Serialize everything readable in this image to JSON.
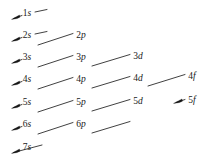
{
  "figure": {
    "width": 206,
    "height": 162,
    "background_color": "#ffffff",
    "line_color": "#2b2b2b",
    "text_color": "#1a1a1a"
  },
  "orbitals": [
    {
      "id": "1s",
      "n": "1",
      "l": "s",
      "label": "1s",
      "x": 27,
      "y": 14
    },
    {
      "id": "2s",
      "n": "2",
      "l": "s",
      "label": "2s",
      "x": 27,
      "y": 36
    },
    {
      "id": "2p",
      "n": "2",
      "l": "p",
      "label": "2p",
      "x": 81,
      "y": 36
    },
    {
      "id": "3s",
      "n": "3",
      "l": "s",
      "label": "3s",
      "x": 27,
      "y": 58
    },
    {
      "id": "3p",
      "n": "3",
      "l": "p",
      "label": "3p",
      "x": 81,
      "y": 58
    },
    {
      "id": "3d",
      "n": "3",
      "l": "d",
      "label": "3d",
      "x": 138,
      "y": 57
    },
    {
      "id": "4s",
      "n": "4",
      "l": "s",
      "label": "4s",
      "x": 27,
      "y": 80
    },
    {
      "id": "4p",
      "n": "4",
      "l": "p",
      "label": "4p",
      "x": 81,
      "y": 80
    },
    {
      "id": "4d",
      "n": "4",
      "l": "d",
      "label": "4d",
      "x": 138,
      "y": 79
    },
    {
      "id": "4f",
      "n": "4",
      "l": "f",
      "label": "4f",
      "x": 192,
      "y": 77
    },
    {
      "id": "5s",
      "n": "5",
      "l": "s",
      "label": "5s",
      "x": 27,
      "y": 103
    },
    {
      "id": "5p",
      "n": "5",
      "l": "p",
      "label": "5p",
      "x": 81,
      "y": 103
    },
    {
      "id": "5d",
      "n": "5",
      "l": "d",
      "label": "5d",
      "x": 138,
      "y": 102
    },
    {
      "id": "5f",
      "n": "5",
      "l": "f",
      "label": "5f",
      "x": 192,
      "y": 101
    },
    {
      "id": "6s",
      "n": "6",
      "l": "s",
      "label": "6s",
      "x": 27,
      "y": 125
    },
    {
      "id": "6p",
      "n": "6",
      "l": "p",
      "label": "6p",
      "x": 81,
      "y": 125
    },
    {
      "id": "7s",
      "n": "7",
      "l": "s",
      "label": "7s",
      "x": 27,
      "y": 148
    }
  ],
  "arrows": [
    {
      "id": "arrow-1s",
      "from": "1s-stub",
      "to": "1s",
      "x1": 41,
      "y1": 9,
      "x2": 14,
      "y2": 18,
      "head": true
    },
    {
      "id": "arrow-2p-2s",
      "from": "2p",
      "to": "2s",
      "x1": 41,
      "y1": 31,
      "x2": 14,
      "y2": 40,
      "head": true
    },
    {
      "id": "arrow-2p-tail",
      "from": "2p-stub",
      "to": "2p",
      "x1": 72,
      "y1": 31,
      "x2": 41,
      "y2": 41,
      "head": false
    },
    {
      "id": "arrow-3p-3s",
      "from": "3p",
      "to": "3s",
      "x1": 41,
      "y1": 53,
      "x2": 14,
      "y2": 62,
      "head": true
    },
    {
      "id": "arrow-3d-3p",
      "from": "3d",
      "to": "3p",
      "x1": 129,
      "y1": 52,
      "x2": 41,
      "y2": 81,
      "head": false
    },
    {
      "id": "arrow-4p-4s",
      "from": "4p",
      "to": "4s",
      "x1": 41,
      "y1": 75,
      "x2": 14,
      "y2": 84,
      "head": true
    },
    {
      "id": "arrow-4d-4p",
      "from": "4d",
      "to": "4p",
      "x1": 129,
      "y1": 74,
      "x2": 41,
      "y2": 103,
      "head": false
    },
    {
      "id": "arrow-4f-4d",
      "from": "4f",
      "to": "4d",
      "x1": 184,
      "y1": 72,
      "x2": 129,
      "y2": 96,
      "head": false
    },
    {
      "id": "arrow-5p-5s",
      "from": "5p",
      "to": "5s",
      "x1": 41,
      "y1": 98,
      "x2": 14,
      "y2": 107,
      "head": true
    },
    {
      "id": "arrow-5d-5p",
      "from": "5d",
      "to": "5p",
      "x1": 129,
      "y1": 97,
      "x2": 41,
      "y2": 126,
      "head": false
    },
    {
      "id": "arrow-5f",
      "from": "5f-stub",
      "to": "5f",
      "x1": 184,
      "y1": 96,
      "x2": 172,
      "y2": 104,
      "head": true
    },
    {
      "id": "arrow-6p-6s",
      "from": "6p",
      "to": "6s",
      "x1": 41,
      "y1": 120,
      "x2": 14,
      "y2": 129,
      "head": true
    },
    {
      "id": "arrow-6p-tail",
      "from": "6p-stub",
      "to": "6p",
      "x1": 129,
      "y1": 119,
      "x2": 72,
      "y2": 130,
      "head": false
    },
    {
      "id": "arrow-7s",
      "from": "7s-stub",
      "to": "7s",
      "x1": 41,
      "y1": 143,
      "x2": 14,
      "y2": 152,
      "head": true
    }
  ],
  "diagonal_segments": [
    {
      "id": "seg-2p",
      "x1": 72,
      "y1": 31,
      "x2": 41,
      "y2": 41
    },
    {
      "id": "seg-3p",
      "x1": 72,
      "y1": 53,
      "x2": 41,
      "y2": 64
    },
    {
      "id": "seg-3d-to-3p",
      "x1": 129,
      "y1": 52,
      "x2": 90,
      "y2": 64
    },
    {
      "id": "seg-4p",
      "x1": 72,
      "y1": 75,
      "x2": 41,
      "y2": 86
    },
    {
      "id": "seg-4d-to-4p",
      "x1": 129,
      "y1": 74,
      "x2": 90,
      "y2": 86
    },
    {
      "id": "seg-4f-to-4d",
      "x1": 184,
      "y1": 72,
      "x2": 147,
      "y2": 84
    },
    {
      "id": "seg-5p",
      "x1": 72,
      "y1": 98,
      "x2": 41,
      "y2": 109
    },
    {
      "id": "seg-5d-to-5p",
      "x1": 129,
      "y1": 97,
      "x2": 90,
      "y2": 109
    },
    {
      "id": "seg-6p",
      "x1": 72,
      "y1": 120,
      "x2": 41,
      "y2": 131
    },
    {
      "id": "seg-6p-right",
      "x1": 129,
      "y1": 119,
      "x2": 90,
      "y2": 131
    }
  ],
  "stubs": [
    {
      "id": "stub-1s",
      "x1": 46,
      "y1": 9,
      "x2": 34,
      "y2": 12
    },
    {
      "id": "stub-2s",
      "x1": 46,
      "y1": 31,
      "x2": 34,
      "y2": 34
    }
  ]
}
